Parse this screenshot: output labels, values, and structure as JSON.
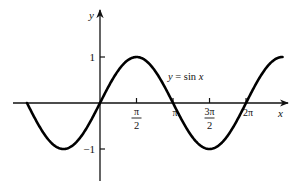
{
  "chart_data": {
    "type": "line",
    "title": "",
    "function": "y = sin x",
    "annotation": "y = sin x",
    "xlabel": "x",
    "ylabel": "y",
    "xlim": [
      -3.1416,
      7.854
    ],
    "ylim": [
      -1,
      1
    ],
    "x_ticks": [
      {
        "value": 1.5708,
        "label_num": "π",
        "label_den": "2",
        "kind": "fraction"
      },
      {
        "value": 3.1416,
        "label": "π",
        "kind": "simple"
      },
      {
        "value": 4.7124,
        "label_num": "3π",
        "label_den": "2",
        "kind": "fraction"
      },
      {
        "value": 6.2832,
        "label": "2π",
        "kind": "simple"
      }
    ],
    "y_ticks": [
      {
        "value": 1,
        "label": "1"
      },
      {
        "value": -1,
        "label": "−1"
      }
    ],
    "series": [
      {
        "name": "y = sin x",
        "x": [
          -3.1416,
          -1.5708,
          0,
          1.5708,
          3.1416,
          4.7124,
          6.2832,
          7.854
        ],
        "values": [
          0,
          -1,
          0,
          1,
          0,
          -1,
          0,
          1
        ]
      }
    ],
    "grid": false,
    "legend": "none",
    "colors": {
      "curve": "#000000",
      "axis": "#111111"
    }
  },
  "layout": {
    "origin_px": [
      100,
      103
    ],
    "px_per_unit_x": 23.24,
    "px_per_unit_y": 46,
    "x_axis_px": [
      13,
      288
    ],
    "y_axis_px": [
      10,
      181
    ]
  }
}
